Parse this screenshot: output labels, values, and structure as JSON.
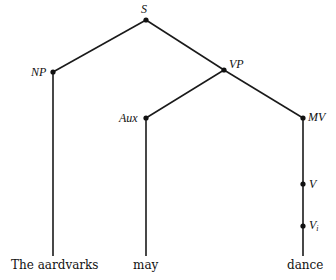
{
  "diagram": {
    "type": "syntax-tree",
    "nodes": {
      "S": {
        "label": "S",
        "x": 146,
        "y": 20
      },
      "NP": {
        "label": "NP",
        "x": 53,
        "y": 72
      },
      "VP": {
        "label": "VP",
        "x": 224,
        "y": 70
      },
      "Aux": {
        "label": "Aux",
        "x": 146,
        "y": 118
      },
      "MV": {
        "label": "MV",
        "x": 303,
        "y": 118
      },
      "V": {
        "label": "V",
        "x": 303,
        "y": 184
      },
      "Vi": {
        "label": "V",
        "subscript": "i",
        "x": 303,
        "y": 226
      }
    },
    "edges": [
      [
        "S",
        "NP"
      ],
      [
        "S",
        "VP"
      ],
      [
        "VP",
        "Aux"
      ],
      [
        "VP",
        "MV"
      ],
      [
        "NP",
        "the_aardvarks"
      ],
      [
        "Aux",
        "may"
      ],
      [
        "MV",
        "V"
      ],
      [
        "V",
        "Vi"
      ],
      [
        "Vi",
        "dance"
      ]
    ],
    "leaves": {
      "the_aardvarks": {
        "text": "The aardvarks",
        "x": 53
      },
      "may": {
        "text": "may",
        "x": 146
      },
      "dance": {
        "text": "dance",
        "x": 303
      }
    }
  }
}
